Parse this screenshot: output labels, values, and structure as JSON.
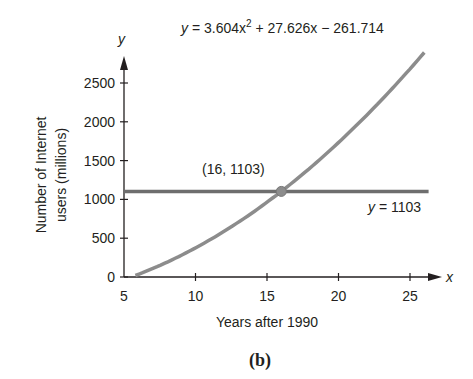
{
  "chart_data": {
    "type": "line",
    "title": "",
    "caption": "(b)",
    "xlabel": "Years after 1990",
    "ylabel": "Number of Internet users (millions)",
    "ylabel_lines": [
      "Number of Internet",
      "users (millions)"
    ],
    "x_axis_symbol": "x",
    "y_axis_symbol": "y",
    "xlim": [
      5,
      26
    ],
    "ylim": [
      0,
      2900
    ],
    "x_ticks": [
      5,
      10,
      15,
      20,
      25
    ],
    "x_tick_labels": [
      "5",
      "10",
      "15",
      "20",
      "25"
    ],
    "y_ticks": [
      0,
      500,
      1000,
      1500,
      2000,
      2500
    ],
    "y_tick_labels": [
      "0",
      "500",
      "1000",
      "1500",
      "2000",
      "2500"
    ],
    "grid": false,
    "series": [
      {
        "name": "y = 3.604x² + 27.626x − 261.714",
        "kind": "quadratic",
        "coefficients": {
          "a": 3.604,
          "b": 27.626,
          "c": -261.714
        },
        "x_range": [
          5.8,
          26
        ],
        "color": "#8a8a8a"
      },
      {
        "name": "y = 1103",
        "kind": "horizontal",
        "value": 1103,
        "x_range": [
          5,
          26.3
        ],
        "color": "#6e6e6e"
      }
    ],
    "annotations": [
      {
        "text": "(16, 1103)",
        "x": 16,
        "y": 1103,
        "type": "intersection-point"
      },
      {
        "text": "y = 3.604x² + 27.626x − 261.714",
        "position": "top"
      },
      {
        "text": "y = 1103",
        "position": "below line, right"
      }
    ]
  },
  "labels": {
    "equation_curve_prefix": "y",
    "equation_curve_body": " = 3.604x",
    "equation_curve_exp": "2",
    "equation_curve_rest": " + 27.626x − 261.714",
    "equation_line": "y = 1103",
    "equation_line_y": "y",
    "equation_line_rest": " = 1103",
    "point_label": "(16, 1103)",
    "xlabel": "Years after 1990",
    "ylabel_1": "Number of Internet",
    "ylabel_2": "users (millions)",
    "x_symbol": "x",
    "y_symbol": "y",
    "caption": "(b)",
    "x_ticks": [
      "5",
      "10",
      "15",
      "20",
      "25"
    ],
    "y_ticks": [
      "0",
      "500",
      "1000",
      "1500",
      "2000",
      "2500"
    ]
  }
}
